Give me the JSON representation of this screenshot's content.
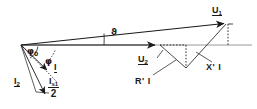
{
  "diagram": {
    "background_color": "#ffffff",
    "stroke_color": "#1a1a1a",
    "axis_color": "#8c8c8c",
    "labels": {
      "u1": "U",
      "u1_sub": "1",
      "u2": "U",
      "u2_sub": "2",
      "i": "I",
      "i2": "I",
      "i2_sub": "2",
      "is1_num": "I",
      "is1_num_sub": "s1",
      "is1_den": "2",
      "phi0": "φ",
      "phi0_sub": "0",
      "phi": "φ",
      "theta": "ϑ",
      "r_prime_i": "R' I",
      "x_prime_i": "X' I"
    },
    "geometry": {
      "origin": [
        21,
        45
      ],
      "u1_tip": [
        228,
        23
      ],
      "u2_tip": [
        160,
        45
      ],
      "baseline_end": [
        249,
        45
      ],
      "theta_vertex": [
        21,
        45
      ],
      "theta_label_pos": [
        106,
        29
      ],
      "phi0_arc_deg": 58,
      "phi_arc_deg": 72
    }
  }
}
